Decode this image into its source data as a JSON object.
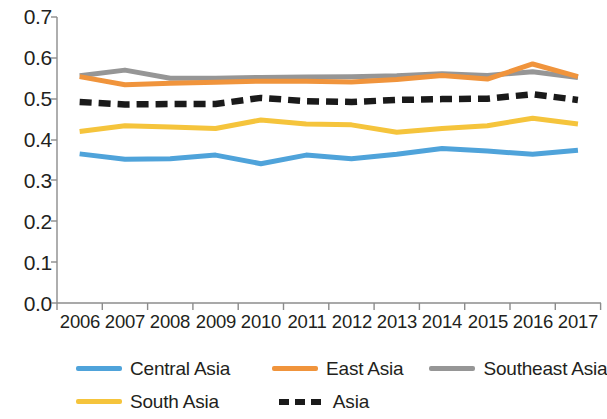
{
  "chart_data": {
    "type": "line",
    "title": "",
    "subtitle": "",
    "xlabel": "",
    "ylabel": "",
    "x": [
      "2006",
      "2007",
      "2008",
      "2009",
      "2010",
      "2011",
      "2012",
      "2013",
      "2014",
      "2015",
      "2016",
      "2017"
    ],
    "categories": [
      "2006",
      "2007",
      "2008",
      "2009",
      "2010",
      "2011",
      "2012",
      "2013",
      "2014",
      "2015",
      "2016",
      "2017"
    ],
    "ylim": [
      0.0,
      0.7
    ],
    "ytick_labels": [
      "0.0",
      "0.1",
      "0.2",
      "0.3",
      "0.4",
      "0.5",
      "0.6",
      "0.7"
    ],
    "ytick_values": [
      0.0,
      0.1,
      0.2,
      0.3,
      0.4,
      0.5,
      0.6,
      0.7
    ],
    "grid": false,
    "legend_position": "bottom",
    "series": [
      {
        "name": "Central Asia",
        "color": "#4FA3DA",
        "style": "solid",
        "values": [
          0.365,
          0.352,
          0.353,
          0.362,
          0.341,
          0.362,
          0.353,
          0.364,
          0.378,
          0.372,
          0.364,
          0.374
        ]
      },
      {
        "name": "East Asia",
        "color": "#F0943C",
        "style": "solid",
        "values": [
          0.554,
          0.534,
          0.538,
          0.54,
          0.543,
          0.543,
          0.541,
          0.547,
          0.557,
          0.548,
          0.585,
          0.554
        ]
      },
      {
        "name": "Southeast Asia",
        "color": "#969696",
        "style": "solid",
        "values": [
          0.556,
          0.57,
          0.55,
          0.55,
          0.552,
          0.553,
          0.554,
          0.556,
          0.561,
          0.557,
          0.566,
          0.552
        ]
      },
      {
        "name": "South Asia",
        "color": "#F5C43C",
        "style": "solid",
        "values": [
          0.42,
          0.434,
          0.431,
          0.427,
          0.448,
          0.438,
          0.436,
          0.418,
          0.427,
          0.434,
          0.452,
          0.438
        ]
      },
      {
        "name": "Asia",
        "color": "#1A1A1A",
        "style": "dashed",
        "values": [
          0.492,
          0.486,
          0.487,
          0.487,
          0.502,
          0.494,
          0.492,
          0.497,
          0.499,
          0.5,
          0.511,
          0.497
        ]
      }
    ]
  },
  "axes": {
    "y_ticks": [
      "0.7",
      "0.6",
      "0.5",
      "0.4",
      "0.3",
      "0.2",
      "0.1",
      "0.0"
    ],
    "x_ticks": [
      "2006",
      "2007",
      "2008",
      "2009",
      "2010",
      "2011",
      "2012",
      "2013",
      "2014",
      "2015",
      "2016",
      "2017"
    ]
  },
  "legend": {
    "row1": [
      {
        "label": "Central Asia",
        "color": "#4FA3DA",
        "style": "solid"
      },
      {
        "label": "East Asia",
        "color": "#F0943C",
        "style": "solid"
      },
      {
        "label": "Southeast Asia",
        "color": "#969696",
        "style": "solid"
      }
    ],
    "row2": [
      {
        "label": "South Asia",
        "color": "#F5C43C",
        "style": "solid"
      },
      {
        "label": "Asia",
        "color": "#1A1A1A",
        "style": "dashed"
      }
    ]
  }
}
